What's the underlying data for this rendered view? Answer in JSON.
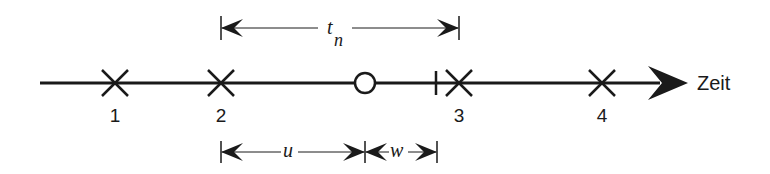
{
  "diagram": {
    "axis_label": "Zeit",
    "events": [
      {
        "label": "1",
        "marker": "x-mark",
        "x": 115
      },
      {
        "label": "2",
        "marker": "x-mark",
        "x": 221
      },
      {
        "label": "3",
        "marker": "x-mark",
        "x": 459
      },
      {
        "label": "4",
        "marker": "x-mark",
        "x": 602
      }
    ],
    "observation_point": {
      "marker": "circle",
      "x": 365
    },
    "tick_mark": {
      "marker": "vertical-tick",
      "x": 436
    },
    "intervals": {
      "t_n": {
        "symbol": "t",
        "subscript": "n",
        "from": "2",
        "to": "3"
      },
      "u": {
        "symbol": "u",
        "from": "2",
        "to": "observation-point"
      },
      "w": {
        "symbol": "w",
        "from": "observation-point",
        "to": "tick-mark"
      }
    }
  }
}
